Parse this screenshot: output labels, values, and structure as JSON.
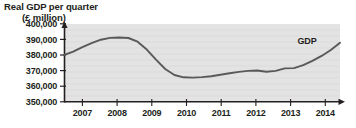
{
  "chart_data": {
    "type": "line",
    "title": "Real GDP per quarter",
    "subtitle": "(£ million)",
    "xlabel": "",
    "ylabel": "",
    "ylim": [
      350000,
      400000
    ],
    "xlim": [
      2006.75,
      2014.25
    ],
    "yticks": [
      "350,000",
      "360,000",
      "370,000",
      "380,000",
      "390,000",
      "400,000"
    ],
    "ytick_values": [
      350000,
      360000,
      370000,
      380000,
      390000,
      400000
    ],
    "xticks": [
      "2007",
      "2008",
      "2009",
      "2010",
      "2011",
      "2012",
      "2013",
      "2014"
    ],
    "xtick_values": [
      2007,
      2008,
      2009,
      2010,
      2011,
      2012,
      2013,
      2014
    ],
    "grid": true,
    "legend_position": "inline-right",
    "plot_background": "#e3e3e3",
    "line_color": "#58595b",
    "axis_color": "#231f20",
    "series": [
      {
        "name": "GDP",
        "label": "GDP",
        "x": [
          2006.75,
          2007.0,
          2007.25,
          2007.5,
          2007.75,
          2008.0,
          2008.25,
          2008.5,
          2008.75,
          2009.0,
          2009.25,
          2009.5,
          2009.75,
          2010.0,
          2010.25,
          2010.5,
          2010.75,
          2011.0,
          2011.25,
          2011.5,
          2011.75,
          2012.0,
          2012.25,
          2012.5,
          2012.75,
          2013.0,
          2013.25,
          2013.5,
          2013.75,
          2014.0,
          2014.25
        ],
        "values": [
          380000,
          382200,
          385000,
          387600,
          389800,
          391000,
          391200,
          390900,
          388500,
          383500,
          377000,
          371000,
          367200,
          365700,
          365500,
          365800,
          366400,
          367300,
          368300,
          369200,
          369800,
          370100,
          369300,
          369800,
          371400,
          371600,
          373500,
          376200,
          379400,
          383200,
          387900
        ]
      }
    ]
  }
}
